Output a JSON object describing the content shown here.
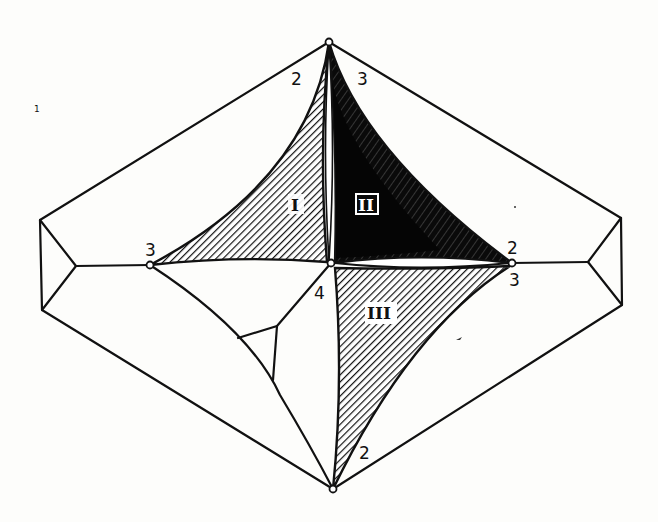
{
  "diagram": {
    "type": "geometric-figure",
    "colors": {
      "ink": "#111111",
      "background": "#fdfdfb",
      "region_I_fill": "hatched",
      "region_II_fill": "solid-black",
      "region_III_fill": "hatched"
    },
    "regions": [
      {
        "id": "I",
        "label": "I",
        "shading": "diagonal hatching"
      },
      {
        "id": "II",
        "label": "II",
        "shading": "solid black with light streaks"
      },
      {
        "id": "III",
        "label": "III",
        "shading": "diagonal hatching"
      }
    ],
    "vertex_labels": {
      "top_left": "2",
      "top_right": "3",
      "left_node": "3",
      "right_node_upper": "2",
      "right_node_lower": "3",
      "center_lower": "4",
      "bottom_right": "2"
    },
    "stray_mark": "1"
  }
}
